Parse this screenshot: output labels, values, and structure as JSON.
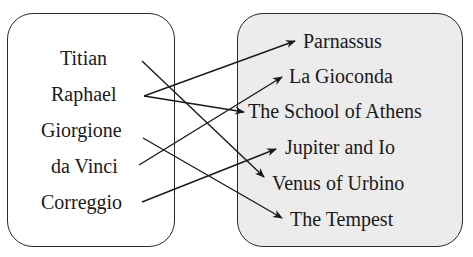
{
  "diagram": {
    "type": "mapping",
    "left_set": {
      "items": [
        "Titian",
        "Raphael",
        "Giorgione",
        "da Vinci",
        "Correggio"
      ]
    },
    "right_set": {
      "items": [
        "Parnassus",
        "La Gioconda",
        "The School of Athens",
        "Jupiter and Io",
        "Venus of Urbino",
        "The Tempest"
      ]
    },
    "mappings": [
      {
        "from": "Titian",
        "to": "Venus of Urbino"
      },
      {
        "from": "Raphael",
        "to": "Parnassus"
      },
      {
        "from": "Raphael",
        "to": "The School of Athens"
      },
      {
        "from": "Giorgione",
        "to": "The Tempest"
      },
      {
        "from": "da Vinci",
        "to": "La Gioconda"
      },
      {
        "from": "Correggio",
        "to": "Jupiter and Io"
      }
    ],
    "colors": {
      "left_fill": "#ffffff",
      "right_fill": "#ececec",
      "stroke": "#2a2a2a"
    }
  }
}
